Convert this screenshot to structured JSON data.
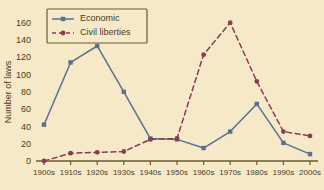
{
  "chart_data": {
    "type": "line",
    "title": "",
    "xlabel": "",
    "ylabel": "Number of laws",
    "categories": [
      "1900s",
      "1910s",
      "1920s",
      "1930s",
      "1940s",
      "1950s",
      "1960s",
      "1970s",
      "1980s",
      "1990s",
      "2000s"
    ],
    "ylim": [
      0,
      170
    ],
    "yticks": [
      0,
      20,
      40,
      60,
      80,
      100,
      120,
      140,
      160
    ],
    "grid": false,
    "legend_position": "top-left",
    "series": [
      {
        "name": "Economic",
        "color": "#5a6f91",
        "marker": "square",
        "linestyle": "solid",
        "values": [
          42,
          114,
          133,
          80,
          26,
          25,
          15,
          34,
          66,
          21,
          8
        ]
      },
      {
        "name": "Civil liberties",
        "color": "#8c3a52",
        "marker": "circle",
        "linestyle": "dashed",
        "values": [
          0,
          9,
          10,
          11,
          25,
          26,
          123,
          160,
          92,
          34,
          29
        ]
      }
    ]
  },
  "legend": {
    "entries": [
      {
        "label": "Economic"
      },
      {
        "label": "Civil liberties"
      }
    ]
  },
  "axes": {
    "y_title": "Number of laws",
    "y_tick_labels": [
      "0",
      "20",
      "40",
      "60",
      "80",
      "100",
      "120",
      "140",
      "160"
    ],
    "x_tick_labels": [
      "1900s",
      "1910s",
      "1920s",
      "1930s",
      "1940s",
      "1950s",
      "1960s",
      "1970s",
      "1980s",
      "1990s",
      "2000s"
    ]
  },
  "colors": {
    "background": "#f6e9c8",
    "axis": "#6b5a2e",
    "economic": "#5a6f91",
    "civil_liberties": "#8c3a52",
    "text": "#4a3b20"
  }
}
